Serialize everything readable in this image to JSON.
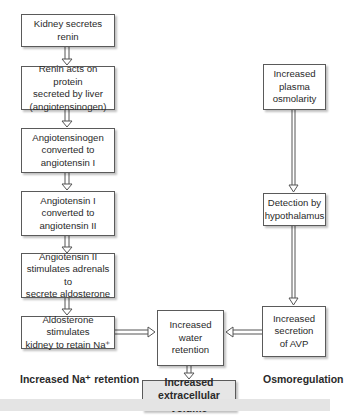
{
  "left_column": {
    "boxes": [
      {
        "text": "Kidney secretes\nrenin"
      },
      {
        "text": "Renin acts on protein\nsecreted by liver\n(angiotensinogen)"
      },
      {
        "text": "Angiotensinogen\nconverted to\nangiotensin I"
      },
      {
        "text": "Angiotensin I\nconverted to\nangiotensin II"
      },
      {
        "text": "Angiotensin II\nstimulates adrenals to\nsecrete aldosterone"
      },
      {
        "text": "Aldosterone stimulates\nkidney to retain Na⁺"
      }
    ],
    "label": "Increased Na⁺ retention"
  },
  "right_column": {
    "boxes": [
      {
        "text": "Increased\nplasma\nosmolarity"
      },
      {
        "text": "Detection by\nhypothalamus"
      },
      {
        "text": "Increased\nsecretion\nof AVP"
      }
    ],
    "label": "Osmoregulation"
  },
  "center": {
    "water_retention": "Increased\nwater\nretention",
    "result": "Increased\nextracellular volume"
  },
  "colors": {
    "box_border": "#5a5a5a",
    "arrow": "#555555",
    "result_fill": "#e6e6e6",
    "footer_bar": "#e4e4e4"
  }
}
